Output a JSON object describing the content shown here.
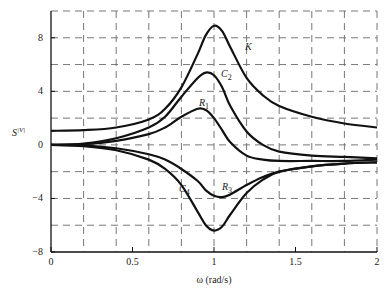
{
  "chart_data": {
    "type": "line",
    "title": "",
    "xlabel": "ω (rad/s)",
    "ylabel": "S^{|V|}",
    "xlim": [
      0,
      2
    ],
    "ylim": [
      -8,
      10
    ],
    "grid": true,
    "x_ticks": [
      "0",
      "0.5",
      "1",
      "1.5",
      "2"
    ],
    "y_ticks": [
      "8",
      "4",
      "0",
      "-4",
      "-8"
    ],
    "x_grid_step": 0.2,
    "y_grid_step": 2,
    "legend_position": "inline labels",
    "x": [
      0,
      0.2,
      0.4,
      0.6,
      0.7,
      0.8,
      0.9,
      0.95,
      1.0,
      1.05,
      1.1,
      1.2,
      1.3,
      1.4,
      1.6,
      1.8,
      2.0
    ],
    "series": [
      {
        "name": "K",
        "label": "K",
        "values": [
          1.05,
          1.1,
          1.3,
          1.9,
          2.7,
          4.3,
          6.8,
          8.2,
          8.9,
          8.5,
          7.3,
          5.0,
          3.7,
          2.9,
          2.1,
          1.6,
          1.3
        ]
      },
      {
        "name": "C2",
        "label": "C₂",
        "values": [
          0,
          0.1,
          0.5,
          1.3,
          2.1,
          3.6,
          5.0,
          5.4,
          5.2,
          4.3,
          2.9,
          1.0,
          0.0,
          -0.5,
          -0.8,
          -0.9,
          -1.0
        ]
      },
      {
        "name": "R1",
        "label": "R₁",
        "values": [
          0,
          0.05,
          0.3,
          0.8,
          1.3,
          2.1,
          2.7,
          2.6,
          2.0,
          1.1,
          0.2,
          -0.8,
          -1.1,
          -1.2,
          -1.2,
          -1.2,
          -1.1
        ]
      },
      {
        "name": "R3",
        "label": "R₃",
        "values": [
          0,
          -0.05,
          -0.25,
          -0.7,
          -1.1,
          -1.8,
          -2.7,
          -3.4,
          -3.8,
          -3.9,
          -3.7,
          -3.0,
          -2.4,
          -2.0,
          -1.6,
          -1.4,
          -1.3
        ]
      },
      {
        "name": "C4",
        "label": "C₄",
        "values": [
          0,
          -0.1,
          -0.4,
          -1.1,
          -1.8,
          -3.0,
          -5.0,
          -6.0,
          -6.4,
          -6.1,
          -5.2,
          -3.6,
          -2.6,
          -2.0,
          -1.6,
          -1.4,
          -1.3
        ]
      }
    ]
  }
}
